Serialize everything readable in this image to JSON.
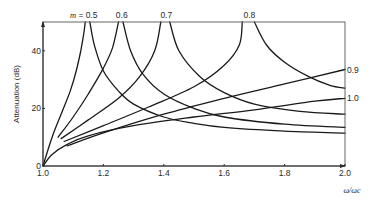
{
  "chart_data": {
    "type": "line",
    "title": "",
    "xlabel": "ω/ωc",
    "ylabel": "Attenuation (dB)",
    "xlim": [
      1.0,
      2.0
    ],
    "ylim": [
      0,
      50
    ],
    "xticks": [
      "1.0",
      "1.2",
      "1.4",
      "1.6",
      "1.8",
      "2.0"
    ],
    "yticks": [
      "0",
      "20",
      "40"
    ],
    "grid": false,
    "legend": "curve labels at line ends (m values)",
    "parameter_prefix": "m =",
    "series": [
      {
        "name": "0.5",
        "label_pos": "top",
        "rising": [
          [
            1.0,
            0
          ],
          [
            1.03,
            10
          ],
          [
            1.06,
            18
          ],
          [
            1.09,
            26
          ],
          [
            1.11,
            33
          ],
          [
            1.125,
            40
          ],
          [
            1.135,
            46
          ],
          [
            1.14,
            50
          ]
        ],
        "falling": [
          [
            1.155,
            50
          ],
          [
            1.17,
            42
          ],
          [
            1.2,
            33
          ],
          [
            1.25,
            26
          ],
          [
            1.3,
            21.5
          ],
          [
            1.4,
            17
          ],
          [
            1.5,
            14.8
          ],
          [
            1.6,
            13.4
          ],
          [
            1.8,
            12.1
          ],
          [
            2.0,
            11.4
          ]
        ]
      },
      {
        "name": "0.6",
        "label_pos": "top",
        "rising": [
          [
            1.05,
            10
          ],
          [
            1.1,
            17
          ],
          [
            1.15,
            25
          ],
          [
            1.2,
            34
          ],
          [
            1.23,
            41
          ],
          [
            1.25,
            50
          ]
        ],
        "falling": [
          [
            1.265,
            50
          ],
          [
            1.29,
            40
          ],
          [
            1.33,
            32
          ],
          [
            1.4,
            25
          ],
          [
            1.5,
            20
          ],
          [
            1.6,
            17
          ],
          [
            1.8,
            14.5
          ],
          [
            2.0,
            13.4
          ]
        ]
      },
      {
        "name": "0.7",
        "label_pos": "top",
        "rising": [
          [
            1.06,
            9.5
          ],
          [
            1.15,
            16
          ],
          [
            1.25,
            23.5
          ],
          [
            1.32,
            31
          ],
          [
            1.37,
            40
          ],
          [
            1.39,
            50
          ]
        ],
        "falling": [
          [
            1.42,
            50
          ],
          [
            1.45,
            40
          ],
          [
            1.52,
            31
          ],
          [
            1.6,
            25.5
          ],
          [
            1.7,
            21.5
          ],
          [
            1.85,
            19
          ],
          [
            2.0,
            18
          ]
        ]
      },
      {
        "name": "0.8",
        "label_pos": "top",
        "rising": [
          [
            1.07,
            8.5
          ],
          [
            1.2,
            14
          ],
          [
            1.35,
            20.5
          ],
          [
            1.5,
            27.5
          ],
          [
            1.6,
            35
          ],
          [
            1.65,
            42
          ],
          [
            1.66,
            50
          ]
        ],
        "falling": [
          [
            1.7,
            50
          ],
          [
            1.74,
            42
          ],
          [
            1.8,
            36
          ],
          [
            1.88,
            31
          ],
          [
            1.95,
            28
          ],
          [
            2.0,
            27
          ]
        ]
      },
      {
        "name": "0.9",
        "label_pos": "right",
        "rising": [
          [
            1.08,
            7
          ],
          [
            1.2,
            11.5
          ],
          [
            1.4,
            18
          ],
          [
            1.6,
            23.5
          ],
          [
            1.8,
            28.5
          ],
          [
            2.0,
            33.5
          ]
        ],
        "falling": []
      },
      {
        "name": "1.0",
        "label_pos": "right",
        "rising": [
          [
            1.0,
            0
          ],
          [
            1.03,
            4
          ],
          [
            1.08,
            7.5
          ],
          [
            1.15,
            10.5
          ],
          [
            1.3,
            14
          ],
          [
            1.5,
            17
          ],
          [
            1.7,
            19.5
          ],
          [
            1.9,
            22.5
          ],
          [
            2.0,
            23.5
          ]
        ],
        "falling": []
      }
    ]
  }
}
